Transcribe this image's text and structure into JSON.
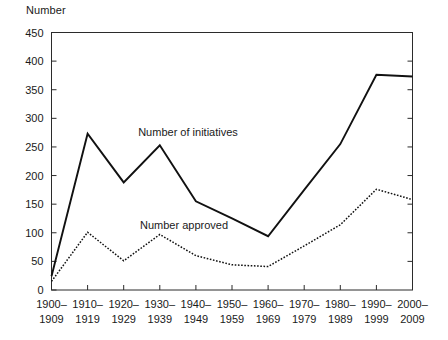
{
  "chart_data": {
    "type": "line",
    "title": "",
    "ylabel": "Number",
    "xlabel": "",
    "ylim": [
      0,
      450
    ],
    "ytick_step": 50,
    "yticks": [
      0,
      50,
      100,
      150,
      200,
      250,
      300,
      350,
      400,
      450
    ],
    "grid": false,
    "legend_position": "inline-annotation",
    "categories": [
      "1900–1909",
      "1910–1919",
      "1920–1929",
      "1930–1939",
      "1940–1949",
      "1950–1959",
      "1960–1969",
      "1970–1979",
      "1980–1989",
      "1990–1999",
      "2000–2009"
    ],
    "categories_line1": [
      "1900–",
      "1910–",
      "1920–",
      "1930–",
      "1940–",
      "1950–",
      "1960–",
      "1970–",
      "1980–",
      "1990–",
      "2000–"
    ],
    "categories_line2": [
      "1909",
      "1919",
      "1929",
      "1939",
      "1949",
      "1959",
      "1969",
      "1979",
      "1989",
      "1999",
      "2009"
    ],
    "series": [
      {
        "name": "Number of initiatives",
        "style": "solid",
        "color": "#111111",
        "values": [
          24,
          273,
          188,
          253,
          155,
          125,
          94,
          175,
          255,
          376,
          373
        ]
      },
      {
        "name": "Number approved",
        "style": "dotted",
        "color": "#111111",
        "values": [
          15,
          101,
          51,
          97,
          60,
          44,
          41,
          77,
          114,
          176,
          158
        ]
      }
    ],
    "annotations": [
      {
        "text": "Number of initiatives",
        "series": "Number of initiatives"
      },
      {
        "text": "Number approved",
        "series": "Number approved"
      }
    ]
  }
}
